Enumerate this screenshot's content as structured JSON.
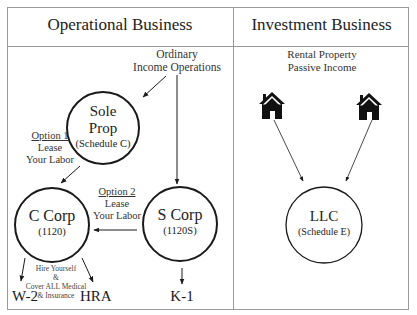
{
  "sections": {
    "operational": {
      "title": "Operational Business"
    },
    "investment": {
      "title": "Investment Business"
    }
  },
  "operational": {
    "source_label": {
      "line1": "Ordinary",
      "line2": "Income Operations"
    },
    "nodes": {
      "sole_prop": {
        "line1": "Sole",
        "line2": "Prop",
        "sub": "(Schedule C)"
      },
      "c_corp": {
        "title": "C Corp",
        "sub": "(1120)"
      },
      "s_corp": {
        "title": "S Corp",
        "sub": "(1120S)"
      }
    },
    "option1": {
      "title": "Option 1",
      "line1": "Lease",
      "line2": "Your Labor"
    },
    "option2": {
      "title": "Option 2",
      "line1": "Lease",
      "line2": "Your Labor"
    },
    "c_corp_note": {
      "line1": "Hire Yourself",
      "line2": "&",
      "line3": "Cover ALL Medical",
      "line4": "& Insurance"
    },
    "outputs": {
      "w2": "W-2",
      "hra": "HRA",
      "k1": "K-1"
    }
  },
  "investment": {
    "source_label": {
      "line1": "Rental Property",
      "line2": "Passive Income"
    },
    "icons": [
      "house-icon",
      "house-icon"
    ],
    "nodes": {
      "llc": {
        "title": "LLC",
        "sub": "(Schedule E)"
      }
    }
  },
  "colors": {
    "line": "#1a1a1a",
    "frame": "#9a9a9a",
    "background": "#ffffff"
  }
}
